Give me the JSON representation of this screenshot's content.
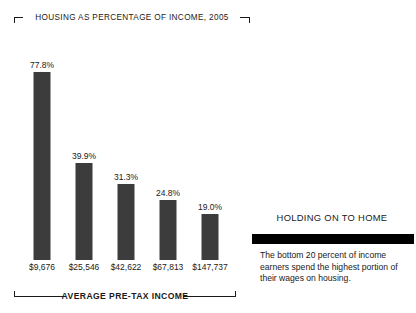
{
  "chart_data": {
    "type": "bar",
    "title": "HOUSING AS PERCENTAGE OF INCOME, 2005",
    "xlabel": "AVERAGE PRE-TAX INCOME",
    "ylabel": "",
    "categories": [
      "$9,676",
      "$25,546",
      "$42,622",
      "$67,813",
      "$147,737"
    ],
    "values": [
      77.8,
      39.9,
      31.3,
      24.8,
      19.0
    ],
    "value_labels": [
      "77.8%",
      "39.9%",
      "31.3%",
      "24.8%",
      "19.0%"
    ],
    "ylim": [
      0,
      90
    ],
    "grid": false,
    "legend": "none",
    "bar_color": "#3c3c3c"
  },
  "chart": {
    "title": "HOUSING AS PERCENTAGE OF INCOME, 2005",
    "axis_label": "AVERAGE PRE-TAX INCOME",
    "bars": [
      {
        "value_label": "77.8%",
        "category": "$9,676"
      },
      {
        "value_label": "39.9%",
        "category": "$25,546"
      },
      {
        "value_label": "31.3%",
        "category": "$42,622"
      },
      {
        "value_label": "24.8%",
        "category": "$67,813"
      },
      {
        "value_label": "19.0%",
        "category": "$147,737"
      }
    ]
  },
  "note": {
    "headline": "HOLDING ON TO HOME",
    "body": "The bottom 20 percent of income earners spend the highest portion of their wages on housing."
  }
}
